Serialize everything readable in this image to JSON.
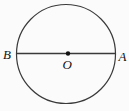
{
  "figure": {
    "background_color": "#fbfbfb",
    "stroke_color": "#3a3a3a",
    "label_color": "#111111",
    "labels": {
      "left_endpoint": "B",
      "right_endpoint": "A",
      "center": "O"
    }
  }
}
